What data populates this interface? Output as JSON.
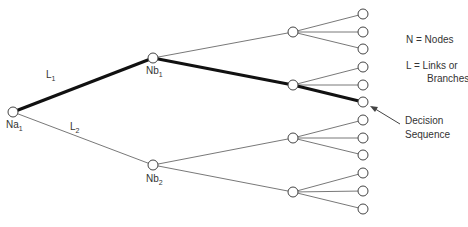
{
  "diagram": {
    "type": "decision-tree",
    "nodes": {
      "root": {
        "label": "Na",
        "sub": "1",
        "x": 13,
        "y": 112
      },
      "level2": [
        {
          "label": "Nb",
          "sub": "1",
          "x": 153,
          "y": 58
        },
        {
          "label": "Nb",
          "sub": "2",
          "x": 153,
          "y": 165
        }
      ],
      "level3": [
        {
          "x": 293,
          "y": 32
        },
        {
          "x": 293,
          "y": 85
        },
        {
          "x": 293,
          "y": 138
        },
        {
          "x": 293,
          "y": 192
        }
      ],
      "leaves_x": 363,
      "leaves_y": [
        14,
        32,
        49,
        67,
        85,
        102,
        120,
        138,
        155,
        173,
        191,
        209
      ]
    },
    "links": [
      {
        "label": "L",
        "sub": "1"
      },
      {
        "label": "L",
        "sub": "2"
      }
    ],
    "legend": {
      "nodes": "N = Nodes",
      "links_line1": "L = Links or",
      "links_line2": "Branches"
    },
    "annotation": {
      "line1": "Decision",
      "line2": "Sequence"
    },
    "highlight_color": "#111111",
    "line_color": "#555555"
  }
}
